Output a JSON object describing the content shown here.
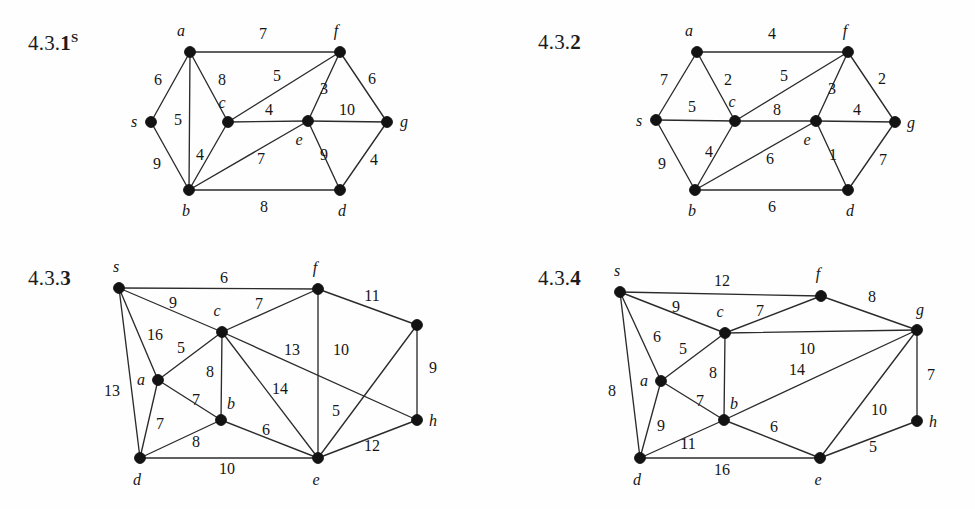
{
  "page": {
    "width": 975,
    "height": 509,
    "background": "#fefefe",
    "ink": "#131313"
  },
  "figures": [
    {
      "id": "fig-431",
      "label_prefix": "4.3.",
      "label_number": "1",
      "label_superscript": "S",
      "label_x": 28,
      "label_y": 30,
      "origin_x": 0,
      "origin_y": 0,
      "nodes": [
        {
          "id": "a",
          "label": "a",
          "x": 190,
          "y": 52,
          "lx": 181,
          "ly": 31
        },
        {
          "id": "s",
          "label": "s",
          "x": 151,
          "y": 122,
          "lx": 134,
          "ly": 122
        },
        {
          "id": "c",
          "label": "c",
          "x": 228,
          "y": 122,
          "lx": 222,
          "ly": 103
        },
        {
          "id": "b",
          "label": "b",
          "x": 189,
          "y": 190,
          "lx": 186,
          "ly": 211
        },
        {
          "id": "f",
          "label": "f",
          "x": 340,
          "y": 52,
          "lx": 336,
          "ly": 31
        },
        {
          "id": "e",
          "label": "e",
          "x": 308,
          "y": 121,
          "lx": 299,
          "ly": 140
        },
        {
          "id": "g",
          "label": "g",
          "x": 387,
          "y": 122,
          "lx": 404,
          "ly": 122
        },
        {
          "id": "d",
          "label": "d",
          "x": 340,
          "y": 190,
          "lx": 342,
          "ly": 211
        }
      ],
      "edges": [
        {
          "u": "a",
          "v": "f",
          "w": "7",
          "lx": 263,
          "ly": 34
        },
        {
          "u": "a",
          "v": "s",
          "w": "6",
          "lx": 158,
          "ly": 80
        },
        {
          "u": "a",
          "v": "c",
          "w": "8",
          "lx": 222,
          "ly": 80
        },
        {
          "u": "a",
          "v": "b",
          "w": "5",
          "lx": 178,
          "ly": 120
        },
        {
          "u": "s",
          "v": "b",
          "w": "9",
          "lx": 157,
          "ly": 164
        },
        {
          "u": "c",
          "v": "b",
          "w": "4",
          "lx": 200,
          "ly": 155
        },
        {
          "u": "c",
          "v": "f",
          "w": "5",
          "lx": 277,
          "ly": 76
        },
        {
          "u": "c",
          "v": "e",
          "w": "4",
          "lx": 269,
          "ly": 110
        },
        {
          "u": "f",
          "v": "e",
          "w": "3",
          "lx": 324,
          "ly": 89
        },
        {
          "u": "f",
          "v": "g",
          "w": "6",
          "lx": 372,
          "ly": 79
        },
        {
          "u": "e",
          "v": "g",
          "w": "10",
          "lx": 347,
          "ly": 110
        },
        {
          "u": "b",
          "v": "e",
          "w": "7",
          "lx": 261,
          "ly": 159
        },
        {
          "u": "e",
          "v": "d",
          "w": "9",
          "lx": 324,
          "ly": 155
        },
        {
          "u": "g",
          "v": "d",
          "w": "4",
          "lx": 374,
          "ly": 160
        },
        {
          "u": "b",
          "v": "d",
          "w": "8",
          "lx": 264,
          "ly": 207
        }
      ]
    },
    {
      "id": "fig-432",
      "label_prefix": "4.3.",
      "label_number": "2",
      "label_superscript": "",
      "label_x": 538,
      "label_y": 30,
      "origin_x": 0,
      "origin_y": 0,
      "nodes": [
        {
          "id": "a",
          "label": "a",
          "x": 697,
          "y": 52,
          "lx": 689,
          "ly": 31
        },
        {
          "id": "s",
          "label": "s",
          "x": 656,
          "y": 120,
          "lx": 639,
          "ly": 121
        },
        {
          "id": "c",
          "label": "c",
          "x": 735,
          "y": 121,
          "lx": 732,
          "ly": 102
        },
        {
          "id": "b",
          "label": "b",
          "x": 695,
          "y": 190,
          "lx": 692,
          "ly": 211
        },
        {
          "id": "f",
          "label": "f",
          "x": 848,
          "y": 52,
          "lx": 845,
          "ly": 31
        },
        {
          "id": "e",
          "label": "e",
          "x": 816,
          "y": 121,
          "lx": 807,
          "ly": 140
        },
        {
          "id": "g",
          "label": "g",
          "x": 895,
          "y": 122,
          "lx": 911,
          "ly": 123
        },
        {
          "id": "d",
          "label": "d",
          "x": 848,
          "y": 190,
          "lx": 850,
          "ly": 211
        }
      ],
      "edges": [
        {
          "u": "a",
          "v": "f",
          "w": "4",
          "lx": 772,
          "ly": 34
        },
        {
          "u": "a",
          "v": "s",
          "w": "7",
          "lx": 664,
          "ly": 80
        },
        {
          "u": "a",
          "v": "c",
          "w": "2",
          "lx": 728,
          "ly": 80
        },
        {
          "u": "s",
          "v": "c",
          "w": "5",
          "lx": 692,
          "ly": 107
        },
        {
          "u": "s",
          "v": "b",
          "w": "9",
          "lx": 662,
          "ly": 164
        },
        {
          "u": "c",
          "v": "b",
          "w": "4",
          "lx": 709,
          "ly": 152
        },
        {
          "u": "c",
          "v": "f",
          "w": "5",
          "lx": 784,
          "ly": 76
        },
        {
          "u": "c",
          "v": "e",
          "w": "8",
          "lx": 777,
          "ly": 110
        },
        {
          "u": "f",
          "v": "e",
          "w": "3",
          "lx": 832,
          "ly": 89
        },
        {
          "u": "f",
          "v": "g",
          "w": "2",
          "lx": 882,
          "ly": 79
        },
        {
          "u": "e",
          "v": "g",
          "w": "4",
          "lx": 857,
          "ly": 110
        },
        {
          "u": "b",
          "v": "e",
          "w": "6",
          "lx": 770,
          "ly": 159
        },
        {
          "u": "e",
          "v": "d",
          "w": "1",
          "lx": 833,
          "ly": 155
        },
        {
          "u": "g",
          "v": "d",
          "w": "7",
          "lx": 883,
          "ly": 160
        },
        {
          "u": "b",
          "v": "d",
          "w": "6",
          "lx": 772,
          "ly": 207
        }
      ]
    },
    {
      "id": "fig-433",
      "label_prefix": "4.3.",
      "label_number": "3",
      "label_superscript": "",
      "label_x": 28,
      "label_y": 266,
      "origin_x": 0,
      "origin_y": 0,
      "nodes": [
        {
          "id": "s",
          "label": "s",
          "x": 119,
          "y": 288,
          "lx": 116,
          "ly": 267
        },
        {
          "id": "c",
          "label": "c",
          "x": 222,
          "y": 332,
          "lx": 217,
          "ly": 311
        },
        {
          "id": "a",
          "label": "a",
          "x": 158,
          "y": 380,
          "lx": 141,
          "ly": 380
        },
        {
          "id": "b",
          "label": "b",
          "x": 221,
          "y": 420,
          "lx": 231,
          "ly": 404
        },
        {
          "id": "d",
          "label": "d",
          "x": 140,
          "y": 458,
          "lx": 137,
          "ly": 480
        },
        {
          "id": "f",
          "label": "f",
          "x": 318,
          "y": 289,
          "lx": 315,
          "ly": 268
        },
        {
          "id": "g",
          "label": "",
          "x": 417,
          "y": 325,
          "lx": 417,
          "ly": 303
        },
        {
          "id": "h",
          "label": "h",
          "x": 417,
          "y": 420,
          "lx": 433,
          "ly": 421
        },
        {
          "id": "e",
          "label": "e",
          "x": 318,
          "y": 458,
          "lx": 316,
          "ly": 480
        }
      ],
      "edges": [
        {
          "u": "s",
          "v": "f",
          "w": "6",
          "lx": 224,
          "ly": 278
        },
        {
          "u": "s",
          "v": "c",
          "w": "9",
          "lx": 173,
          "ly": 303
        },
        {
          "u": "s",
          "v": "a",
          "w": "16",
          "lx": 155,
          "ly": 335
        },
        {
          "u": "s",
          "v": "d",
          "w": "13",
          "lx": 112,
          "ly": 391
        },
        {
          "u": "a",
          "v": "c",
          "w": "5",
          "lx": 181,
          "ly": 348
        },
        {
          "u": "a",
          "v": "b",
          "w": "7",
          "lx": 196,
          "ly": 400
        },
        {
          "u": "a",
          "v": "d",
          "w": "7",
          "lx": 160,
          "ly": 424
        },
        {
          "u": "c",
          "v": "b",
          "w": "8",
          "lx": 210,
          "ly": 372
        },
        {
          "u": "c",
          "v": "f",
          "w": "7",
          "lx": 259,
          "ly": 304
        },
        {
          "u": "c",
          "v": "h",
          "w": "13",
          "lx": 292,
          "ly": 350
        },
        {
          "u": "c",
          "v": "e",
          "w": "14",
          "lx": 280,
          "ly": 389
        },
        {
          "u": "b",
          "v": "d",
          "w": "8",
          "lx": 196,
          "ly": 442
        },
        {
          "u": "b",
          "v": "e",
          "w": "6",
          "lx": 266,
          "ly": 430
        },
        {
          "u": "f",
          "v": "g",
          "w": "11",
          "lx": 372,
          "ly": 296
        },
        {
          "u": "f",
          "v": "e",
          "w": "10",
          "lx": 341,
          "ly": 350
        },
        {
          "u": "g",
          "v": "e",
          "w": "5",
          "lx": 336,
          "ly": 411
        },
        {
          "u": "g",
          "v": "h",
          "w": "9",
          "lx": 433,
          "ly": 368
        },
        {
          "u": "d",
          "v": "e",
          "w": "10",
          "lx": 227,
          "ly": 469
        },
        {
          "u": "e",
          "v": "h",
          "w": "12",
          "lx": 372,
          "ly": 446
        }
      ]
    },
    {
      "id": "fig-434",
      "label_prefix": "4.3.",
      "label_number": "4",
      "label_superscript": "",
      "label_x": 538,
      "label_y": 266,
      "origin_x": 0,
      "origin_y": 0,
      "nodes": [
        {
          "id": "s",
          "label": "s",
          "x": 620,
          "y": 292,
          "lx": 617,
          "ly": 271
        },
        {
          "id": "c",
          "label": "c",
          "x": 725,
          "y": 333,
          "lx": 720,
          "ly": 312
        },
        {
          "id": "a",
          "label": "a",
          "x": 661,
          "y": 381,
          "lx": 644,
          "ly": 381
        },
        {
          "id": "b",
          "label": "b",
          "x": 724,
          "y": 420,
          "lx": 734,
          "ly": 404
        },
        {
          "id": "d",
          "label": "d",
          "x": 640,
          "y": 458,
          "lx": 637,
          "ly": 480
        },
        {
          "id": "f",
          "label": "f",
          "x": 821,
          "y": 296,
          "lx": 818,
          "ly": 274
        },
        {
          "id": "g",
          "label": "g",
          "x": 917,
          "y": 330,
          "lx": 920,
          "ly": 310
        },
        {
          "id": "h",
          "label": "h",
          "x": 917,
          "y": 421,
          "lx": 933,
          "ly": 422
        },
        {
          "id": "e",
          "label": "e",
          "x": 820,
          "y": 458,
          "lx": 818,
          "ly": 480
        }
      ],
      "edges": [
        {
          "u": "s",
          "v": "f",
          "w": "12",
          "lx": 722,
          "ly": 281
        },
        {
          "u": "s",
          "v": "c",
          "w": "9",
          "lx": 676,
          "ly": 307
        },
        {
          "u": "s",
          "v": "a",
          "w": "6",
          "lx": 657,
          "ly": 337
        },
        {
          "u": "s",
          "v": "d",
          "w": "8",
          "lx": 612,
          "ly": 391
        },
        {
          "u": "a",
          "v": "c",
          "w": "5",
          "lx": 683,
          "ly": 349
        },
        {
          "u": "a",
          "v": "b",
          "w": "7",
          "lx": 700,
          "ly": 401
        },
        {
          "u": "a",
          "v": "d",
          "w": "9",
          "lx": 661,
          "ly": 426
        },
        {
          "u": "c",
          "v": "b",
          "w": "8",
          "lx": 713,
          "ly": 373
        },
        {
          "u": "c",
          "v": "f",
          "w": "7",
          "lx": 760,
          "ly": 311
        },
        {
          "u": "c",
          "v": "g",
          "w": "10",
          "lx": 807,
          "ly": 349
        },
        {
          "u": "b",
          "v": "g",
          "w": "14",
          "lx": 797,
          "ly": 370
        },
        {
          "u": "b",
          "v": "d",
          "w": "11",
          "lx": 688,
          "ly": 444
        },
        {
          "u": "b",
          "v": "e",
          "w": "6",
          "lx": 774,
          "ly": 427
        },
        {
          "u": "f",
          "v": "g",
          "w": "8",
          "lx": 872,
          "ly": 297
        },
        {
          "u": "g",
          "v": "h",
          "w": "7",
          "lx": 931,
          "ly": 375
        },
        {
          "u": "g",
          "v": "e",
          "w": "10",
          "lx": 879,
          "ly": 410
        },
        {
          "u": "d",
          "v": "e",
          "w": "16",
          "lx": 722,
          "ly": 470
        },
        {
          "u": "e",
          "v": "h",
          "w": "5",
          "lx": 873,
          "ly": 447
        }
      ]
    }
  ]
}
